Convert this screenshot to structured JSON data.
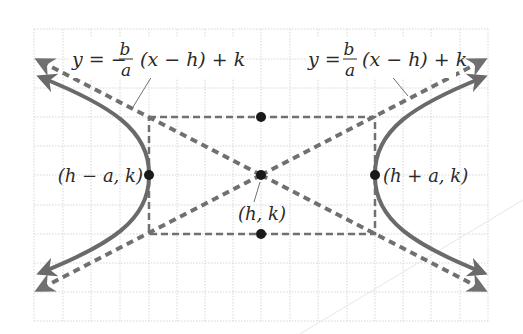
{
  "diagram": {
    "colors": {
      "grid": "#d6d6d6",
      "asymptote": "#707070",
      "curve": "#6a6a6a",
      "point": "#1a1a1a",
      "text": "#2a2a2a",
      "background": "#ffffff"
    },
    "asymptote_left_label": {
      "lhs": "y = −",
      "num": "b",
      "den": "a",
      "rhs": "(x − h) + k"
    },
    "asymptote_right_label": {
      "lhs": "y =",
      "num": "b",
      "den": "a",
      "rhs": "(x − h) + k"
    },
    "points": {
      "left_vertex": "(h − a, k)",
      "right_vertex": "(h + a, k)",
      "center": "(h, k)"
    }
  }
}
